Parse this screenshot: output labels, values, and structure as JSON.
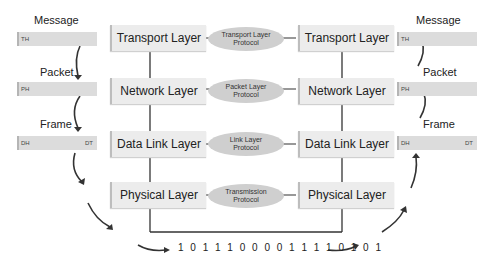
{
  "left_stack": {
    "message_label": "Message",
    "packet_label": "Packet",
    "frame_label": "Frame",
    "message_header": "TH",
    "packet_header": "PH",
    "frame_header": "DH",
    "frame_trailer": "DT"
  },
  "right_stack": {
    "message_label": "Message",
    "packet_label": "Packet",
    "frame_label": "Frame",
    "message_header": "TH",
    "packet_header": "PH",
    "frame_header": "DH",
    "frame_trailer": "DT"
  },
  "layers": {
    "left": [
      "Transport Layer",
      "Network Layer",
      "Data Link Layer",
      "Physical Layer"
    ],
    "right": [
      "Transport Layer",
      "Network Layer",
      "Data Link Layer",
      "Physical Layer"
    ]
  },
  "protocols": [
    {
      "line1": "Transport Layer",
      "line2": "Protocol"
    },
    {
      "line1": "Packet Layer",
      "line2": "Protocol"
    },
    {
      "line1": "Link Layer",
      "line2": "Protocol"
    },
    {
      "line1": "Transmission",
      "line2": "Protocol"
    }
  ],
  "bitstream": "1 0 1 1 1 0 0 0 0 1 1 1 1 0 1 0 1"
}
